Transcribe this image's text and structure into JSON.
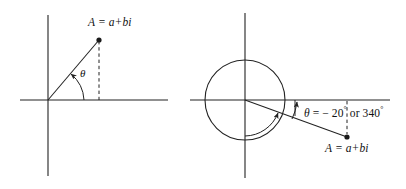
{
  "figure": {
    "background_color": "#ffffff",
    "stroke_color": "#222222",
    "width": 406,
    "height": 189
  },
  "diagrams": [
    {
      "id": "left-diagram",
      "name": "positive-angle-argand-diagram",
      "point_label": "A = a+bi",
      "angle_label": "θ",
      "axes": {
        "origin_x": 48,
        "origin_y": 100,
        "x_start": 20,
        "x_end": 168,
        "y_top": 15,
        "y_bottom": 176
      },
      "vector": {
        "tip_x": 99,
        "tip_y": 40,
        "dashed_drop": true
      },
      "arc": {
        "radius": 36,
        "start_deg": 0,
        "end_deg": 50,
        "arrow": "counterclockwise"
      }
    },
    {
      "id": "right-diagram",
      "name": "negative-angle-argand-diagram",
      "point_label": "A = a+bi",
      "angle_label_symbol": "θ",
      "angle_label_text": "= − 20° or 340°",
      "angle_value_negative": "-20°",
      "angle_value_positive": "340°",
      "degree_symbol": "°",
      "axes": {
        "origin_x": 245,
        "origin_y": 100,
        "x_start": 190,
        "x_end": 390,
        "y_top": 13,
        "y_bottom": 178
      },
      "circle": {
        "center_x": 245,
        "center_y": 100,
        "radius": 40
      },
      "vector": {
        "tip_x": 347,
        "tip_y": 137,
        "dashed_drop": true
      },
      "small_arc": {
        "at_x": 295,
        "description": "small angle arc between horizontal axis and vector"
      },
      "large_arc": {
        "radius": 36,
        "description": "340 degree sweep arc with arrowhead at vector"
      }
    }
  ]
}
